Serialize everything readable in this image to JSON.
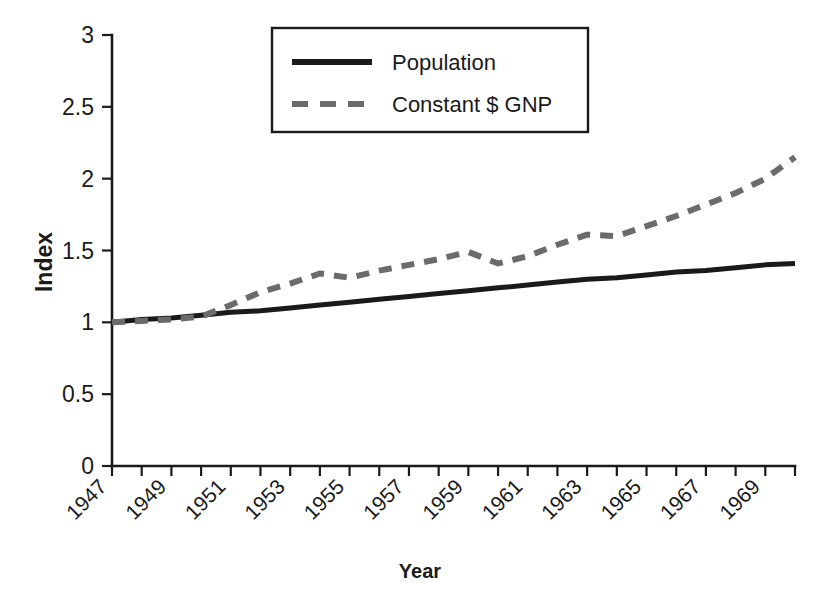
{
  "chart_data": {
    "type": "line",
    "title": "",
    "xlabel": "Year",
    "ylabel": "Index",
    "xlim": [
      1947,
      1970
    ],
    "ylim": [
      0,
      3
    ],
    "grid": false,
    "legend_position": "top-center",
    "y_ticks": [
      "0",
      "0.5",
      "1",
      "1.5",
      "2",
      "2.5",
      "3"
    ],
    "y_tick_values": [
      0,
      0.5,
      1,
      1.5,
      2,
      2.5,
      3
    ],
    "x_tick_labels": [
      "1947",
      "1949",
      "1951",
      "1953",
      "1955",
      "1957",
      "1959",
      "1961",
      "1963",
      "1965",
      "1967",
      "1969"
    ],
    "x_tick_values": [
      1947,
      1949,
      1951,
      1953,
      1955,
      1957,
      1959,
      1961,
      1963,
      1965,
      1967,
      1969
    ],
    "x_minor_ticks": [
      1947,
      1948,
      1949,
      1950,
      1951,
      1952,
      1953,
      1954,
      1955,
      1956,
      1957,
      1958,
      1959,
      1960,
      1961,
      1962,
      1963,
      1964,
      1965,
      1966,
      1967,
      1968,
      1969,
      1970
    ],
    "x": [
      1947,
      1948,
      1949,
      1950,
      1951,
      1952,
      1953,
      1954,
      1955,
      1956,
      1957,
      1958,
      1959,
      1960,
      1961,
      1962,
      1963,
      1964,
      1965,
      1966,
      1967,
      1968,
      1969,
      1970
    ],
    "series": [
      {
        "name": "Population",
        "style": "solid",
        "color": "#1a1a1a",
        "values": [
          1.0,
          1.02,
          1.03,
          1.05,
          1.07,
          1.08,
          1.1,
          1.12,
          1.14,
          1.16,
          1.18,
          1.2,
          1.22,
          1.24,
          1.26,
          1.28,
          1.3,
          1.31,
          1.33,
          1.35,
          1.36,
          1.38,
          1.4,
          1.41
        ]
      },
      {
        "name": "Constant $ GNP",
        "style": "dashed",
        "color": "#6b6b6b",
        "values": [
          1.0,
          1.01,
          1.02,
          1.04,
          1.12,
          1.21,
          1.27,
          1.34,
          1.31,
          1.36,
          1.4,
          1.44,
          1.49,
          1.41,
          1.46,
          1.54,
          1.61,
          1.6,
          1.67,
          1.74,
          1.82,
          1.9,
          2.0,
          2.15
        ]
      }
    ],
    "series_extended_note": "",
    "geometry": {
      "plot_left": 112,
      "plot_right": 795,
      "plot_bottom": 466,
      "plot_top": 35
    }
  },
  "legend": {
    "entries": [
      {
        "label": "Population",
        "style": "solid",
        "color": "#1a1a1a"
      },
      {
        "label": "Constant $ GNP",
        "style": "dashed",
        "color": "#6b6b6b"
      }
    ]
  },
  "axes": {
    "y_title": "Index",
    "x_title": "Year"
  }
}
